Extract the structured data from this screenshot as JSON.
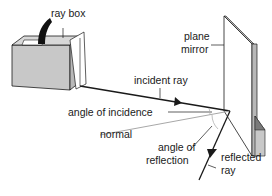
{
  "diagram": {
    "type": "physics-reflection-setup",
    "labels": {
      "ray_box": "ray box",
      "plane_mirror_line1": "plane",
      "plane_mirror_line2": "mirror",
      "incident_ray": "incident ray",
      "angle_of_incidence": "angle of incidence",
      "normal": "normal",
      "angle_of_reflection_line1": "angle of",
      "angle_of_reflection_line2": "reflection",
      "reflected_ray_line1": "reflected",
      "reflected_ray_line2": "ray"
    },
    "colors": {
      "line": "#1a1a1a",
      "box_face": "#c8c8c8",
      "box_top": "#e0e0e0",
      "mirror_edge": "#b0b0b0",
      "normal_line": "#a8a8a8"
    }
  }
}
